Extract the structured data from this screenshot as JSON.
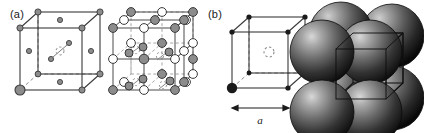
{
  "figure": {
    "background_color": "#ffffff",
    "width": 424,
    "height": 133,
    "panels": [
      {
        "id": "a",
        "label": "(a)",
        "label_x": 10,
        "label_y": 9,
        "description": "Two line-drawn cubic unit cells: a face-centred cubic cell of small grey atoms, and a rock-salt (NaCl-type) 3x3x3 lattice of alternating grey and white spheres."
      },
      {
        "id": "b",
        "label": "(b)",
        "label_x": 208,
        "label_y": 9,
        "description": "A simple cubic cell outline with corner atoms, a dashed interstitial circle at the body centre and a lattice-parameter arrow, beside a shaded space-filling sphere packing of the same cell."
      }
    ]
  },
  "colors": {
    "line": "#3a3a3a",
    "dashed_line": "#8a8a8a",
    "atom_grey_fill": "#8c8c8c",
    "atom_grey_stroke": "#3a3a3a",
    "atom_white_fill": "#ffffff",
    "atom_white_stroke": "#3a3a3a",
    "atom_black_fill": "#1a1a1a",
    "atom_small_grey_fill": "#8c8c8c",
    "sphere_dark": "#161616",
    "sphere_mid": "#4f4f4f",
    "sphere_light": "#b9b9b9",
    "text": "#1a1a1a"
  },
  "cell_fcc": {
    "name": "face-centred-cubic-cell",
    "origin_x": 20,
    "origin_y": 28,
    "edge": 62,
    "depth_x": 18,
    "depth_y": -16,
    "corner_atom_radius": 3.2,
    "face_atom_radius": 2.6,
    "highlight_corner_radius": 5.0,
    "highlight_corner": "front-bottom-left",
    "interstitial": {
      "shown": true,
      "style": "dashed-circle",
      "radius": 4.0
    },
    "atoms": {
      "corners": 8,
      "face_centres": 6
    }
  },
  "cell_rocksalt": {
    "name": "rock-salt-lattice",
    "origin_x": 113,
    "origin_y": 28,
    "edge": 62,
    "depth_x": 18,
    "depth_y": -16,
    "divisions": 2,
    "grey_radius": 4.4,
    "white_radius": 4.4,
    "species": [
      "grey-anion",
      "white-cation"
    ],
    "interstitials": {
      "shown": true,
      "style": "dashed-circle",
      "radius": 3.6
    }
  },
  "cell_simple": {
    "name": "simple-cubic-cell",
    "origin_x": 232,
    "origin_y": 32,
    "edge": 56,
    "depth_x": 17,
    "depth_y": -15,
    "corner_dot_radius": 2.6,
    "front_atom_radius": 5.2,
    "front_atom_corner": "front-bottom-left",
    "body_centre": {
      "shown": true,
      "style": "dashed-circle",
      "radius": 5.0
    },
    "lattice_parameter": {
      "symbol": "a",
      "arrow": "double-headed",
      "arrow_y": 110,
      "arrow_x1": 231,
      "arrow_x2": 290,
      "label_x": 260,
      "label_y": 126
    }
  },
  "sphere_packing": {
    "name": "space-filling-sphere-packing",
    "centre_x": 363,
    "centre_y": 67,
    "sphere_radius": 32,
    "sphere_count": 8,
    "cube_outline": {
      "shown": true,
      "origin_x": 336,
      "origin_y": 33,
      "edge": 50,
      "depth_x": 17,
      "depth_y": -16
    },
    "lighting": "specular highlight upper-left, shading to near-black lower-right"
  }
}
